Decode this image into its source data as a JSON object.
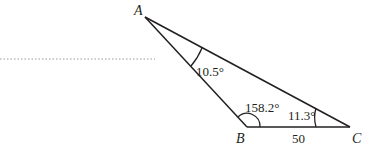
{
  "diagram": {
    "type": "triangle",
    "vertices": {
      "A": {
        "label": "A"
      },
      "B": {
        "label": "B"
      },
      "C": {
        "label": "C"
      }
    },
    "angles": {
      "at_A": "10.5°",
      "at_B": "158.2°",
      "at_C": "11.3°"
    },
    "sides": {
      "BC": "50"
    },
    "colors": {
      "stroke": "#231f20",
      "dotted": "#9a9a9a"
    }
  }
}
